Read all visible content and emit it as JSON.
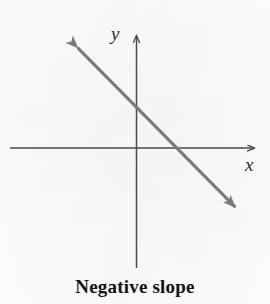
{
  "figure": {
    "caption": "Negative slope",
    "background_color": "#fdfdfd",
    "axis_color": "#4a4a4a",
    "line_color": "#7a7a7a",
    "text_color": "#131313"
  },
  "axes": {
    "y_label": "y",
    "x_label": "x",
    "origin": {
      "x": 136,
      "y": 148
    },
    "x_axis": {
      "start_x": 10,
      "end_x": 258,
      "y": 148,
      "arrow_at": "end"
    },
    "y_axis": {
      "top_y": 31,
      "bottom_y": 268,
      "x": 136,
      "arrow_at": "top"
    }
  },
  "chart_data": {
    "type": "line",
    "title": "Negative slope",
    "xlabel": "x",
    "ylabel": "y",
    "grid": false,
    "legend": null,
    "axis_style": "arrows-both-ends",
    "xlim": [
      -7.5,
      7.5
    ],
    "ylim": [
      -7.5,
      7.5
    ],
    "series": [
      {
        "name": "negative slope line",
        "slope": -1.01,
        "y_intercept": 2.6,
        "arrowheads": [
          "start",
          "end"
        ],
        "x": [
          -4.0,
          4.1
        ],
        "y": [
          6.6,
          -2.0
        ],
        "pixel_endpoints": [
          {
            "x": 70,
            "y": 40
          },
          {
            "x": 243,
            "y": 215
          }
        ]
      }
    ],
    "annotations": [
      {
        "text": "Negative slope",
        "position": "below-axes",
        "weight": "bold"
      }
    ]
  }
}
